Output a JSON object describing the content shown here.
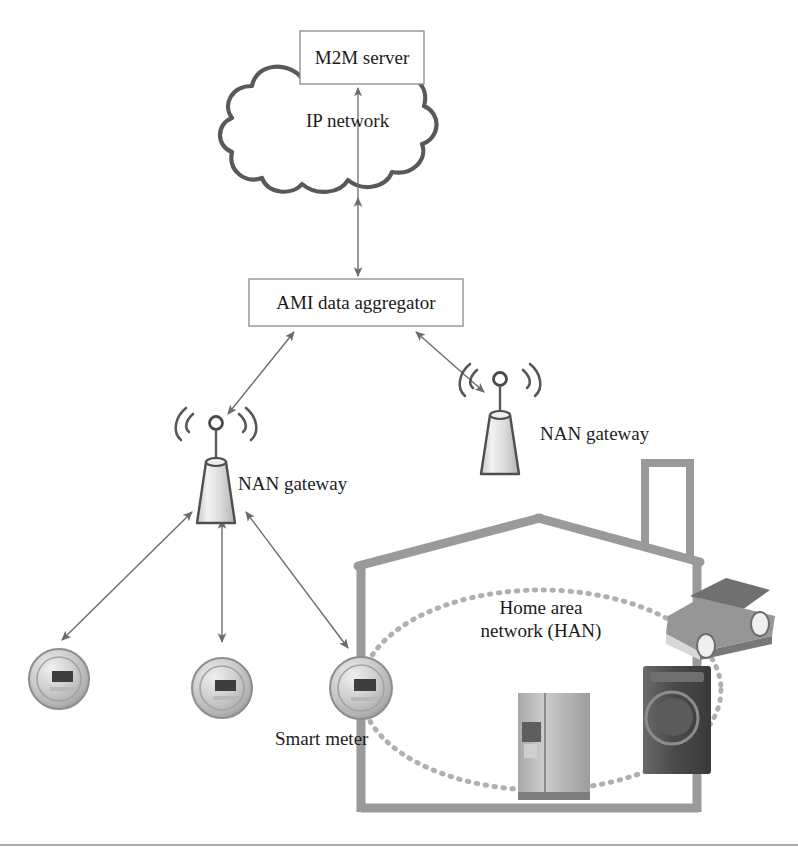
{
  "figure": {
    "kind": "smart-grid-ami-network-architecture-diagram"
  },
  "nodes": {
    "m2m_server": {
      "label": "M2M server"
    },
    "ip_network": {
      "label": "IP network"
    },
    "ami_aggregator": {
      "label": "AMI data aggregator"
    },
    "nan_gateway_left": {
      "label": "NAN gateway"
    },
    "nan_gateway_right": {
      "label": "NAN gateway"
    },
    "smart_meter": {
      "label": "Smart meter"
    },
    "home_area_network": {
      "label_line1": "Home area",
      "label_line2": "network (HAN)"
    }
  },
  "icons": {
    "cloud": "cloud-icon",
    "tower_left": "antenna-tower-icon",
    "tower_right": "antenna-tower-icon",
    "meter_1": "smart-meter-icon",
    "meter_2": "smart-meter-icon",
    "meter_3": "smart-meter-icon",
    "house": "house-outline-icon",
    "refrigerator": "refrigerator-icon",
    "washing_machine": "washing-machine-icon",
    "car": "electric-car-icon",
    "han_ellipse": "dotted-ellipse-icon"
  },
  "connections": [
    {
      "name": "aggregator-to-ip-network",
      "from": "ami_aggregator",
      "to": "ip_network",
      "arrow": "double"
    },
    {
      "name": "ip-network-to-m2m-server",
      "from": "ip_network",
      "to": "m2m_server",
      "arrow": "single-up"
    },
    {
      "name": "aggregator-to-nan-gateway-left",
      "from": "ami_aggregator",
      "to": "nan_gateway_left",
      "arrow": "double"
    },
    {
      "name": "aggregator-to-nan-gateway-right",
      "from": "ami_aggregator",
      "to": "nan_gateway_right",
      "arrow": "double"
    },
    {
      "name": "nan-gateway-left-to-meter-1",
      "from": "nan_gateway_left",
      "to": "meter_1",
      "arrow": "double"
    },
    {
      "name": "nan-gateway-left-to-meter-2",
      "from": "nan_gateway_left",
      "to": "meter_2",
      "arrow": "double"
    },
    {
      "name": "nan-gateway-left-to-meter-3",
      "from": "nan_gateway_left",
      "to": "meter_3",
      "arrow": "double"
    }
  ],
  "colors": {
    "line": "#6b6b6b",
    "cloud_outline": "#595959",
    "box_border": "#8a8a8a",
    "house_wall": "#9a9a9a",
    "text": "#1d1d1d",
    "rule": "#8d8d8d",
    "tower_fill": "#dcdcdc",
    "meter_body": "#bdbdbd",
    "appliance_dark": "#4f4f4f",
    "appliance_light": "#b8b8b8",
    "car_body": "#8f8f8f"
  },
  "typography": {
    "node_label_px": 19,
    "caption_px": 19
  },
  "footer_rule": {
    "name": "bottom-divider"
  }
}
